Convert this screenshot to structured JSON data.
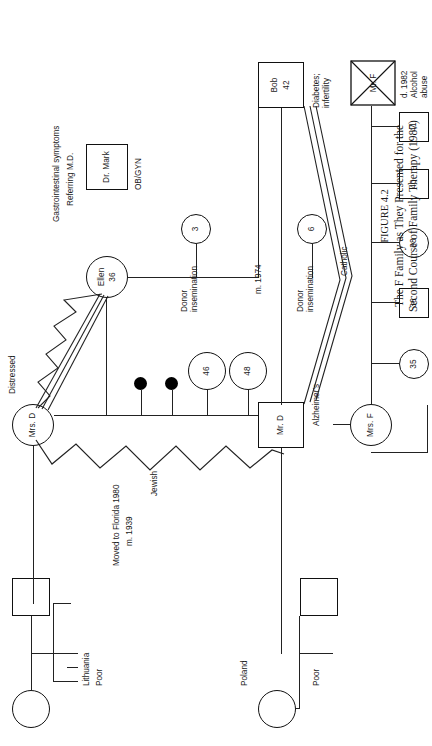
{
  "figure": {
    "number": "FIGURE 4.2",
    "caption_line1": "The F Family as They Presented for the",
    "caption_line2": "Second Course of Family Therapy (1987)"
  },
  "people": {
    "gm_lithuania": {
      "label": ""
    },
    "gf_lithuania": {
      "label": ""
    },
    "gm_poland": {
      "label": ""
    },
    "gf_poland": {
      "label": ""
    },
    "mrs_d": {
      "label": "Mrs. D"
    },
    "mr_d": {
      "label": "Mr. D"
    },
    "mrs_f": {
      "label": "Mrs. F"
    },
    "mr_f": {
      "label": "Mr. F"
    },
    "ellen": {
      "label": "Ellen",
      "age": "36"
    },
    "bob": {
      "label": "Bob",
      "age": "42"
    },
    "d_child_48": {
      "label": "48"
    },
    "d_child_46": {
      "label": "46"
    },
    "f_child_35": {
      "label": "35"
    },
    "f_child_36": {
      "label": "36"
    },
    "f_child_38": {
      "label": "38"
    },
    "f_child_40": {
      "label": "40"
    },
    "f_child_41": {
      "label": "41"
    },
    "child_6": {
      "label": "6"
    },
    "child_3": {
      "label": "3"
    },
    "dr_mark": {
      "label": "Dr. Mark"
    }
  },
  "annotations": {
    "lithuania": "Lithuania",
    "poor_top": "Poor",
    "poland": "Poland",
    "poor_bottom": "Poor",
    "moved_florida": "Moved to Florida 1980",
    "married_1939": "m. 1939",
    "jewish": "Jewish",
    "catholic": "Catholic",
    "alzheimers": "Alzheimer's",
    "distressed": "Distressed",
    "gastrointestinal": "Gastrointestinal symptoms",
    "referring_md": "Referring M.D.",
    "obgyn": "OB/GYN",
    "married_1974": "m. 1974",
    "donor_insemination_1_line1": "Donor",
    "donor_insemination_1_line2": "insemination",
    "donor_insemination_2_line1": "Donor",
    "donor_insemination_2_line2": "insemination",
    "diabetes_line1": "Diabetes;",
    "diabetes_line2": "infertility",
    "mr_f_death_line1": "d. 1982",
    "mr_f_death_line2": "Alcohol",
    "mr_f_death_line3": "abuse"
  },
  "colors": {
    "ink": "#111111",
    "line": "#222222",
    "paper": "#ffffff",
    "filled_node": "#000000"
  }
}
